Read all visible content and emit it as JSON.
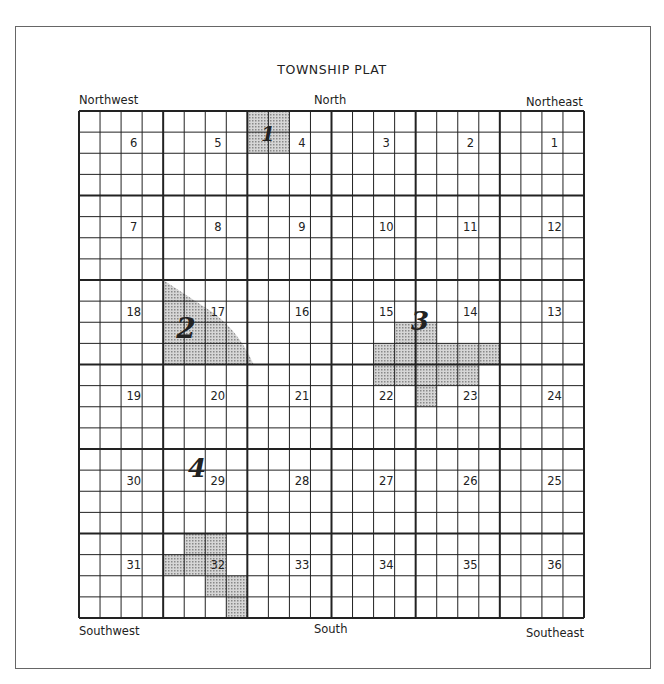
{
  "title": "TOWNSHIP PLAT",
  "directions": {
    "northwest": "Northwest",
    "north": "North",
    "northeast": "Northeast",
    "southwest": "Southwest",
    "south": "South",
    "southeast": "Southeast"
  },
  "sections": [
    [
      "6",
      "5",
      "4",
      "3",
      "2",
      "1"
    ],
    [
      "7",
      "8",
      "9",
      "10",
      "11",
      "12"
    ],
    [
      "18",
      "17",
      "16",
      "15",
      "14",
      "13"
    ],
    [
      "19",
      "20",
      "21",
      "22",
      "23",
      "24"
    ],
    [
      "30",
      "29",
      "28",
      "27",
      "26",
      "25"
    ],
    [
      "31",
      "32",
      "33",
      "34",
      "35",
      "36"
    ]
  ],
  "areas": [
    {
      "label": "1",
      "section": "4"
    },
    {
      "label": "2",
      "section": "17"
    },
    {
      "label": "3",
      "section": "15/14"
    },
    {
      "label": "4",
      "section": "29"
    }
  ],
  "colors": {
    "grid": "#222222",
    "shade": "#bdbdbd",
    "frame": "#666666"
  }
}
